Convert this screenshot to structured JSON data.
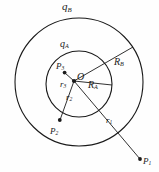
{
  "figure": {
    "center": {
      "label": "O",
      "x": 74,
      "y": 81
    },
    "circles": [
      {
        "name": "outer-shell",
        "charge_label": "q",
        "charge_sub": "B",
        "radius_label": "R",
        "radius_sub": "B",
        "cx": 79,
        "cy": 82,
        "r": 64
      },
      {
        "name": "inner-shell",
        "charge_label": "q",
        "charge_sub": "A",
        "radius_label": "R",
        "radius_sub": "A",
        "cx": 79,
        "cy": 84,
        "r": 33
      }
    ],
    "labels": {
      "q_b": "q",
      "q_b_sub": "B",
      "q_a": "q",
      "q_a_sub": "A",
      "origin": "O",
      "R_b": "R",
      "R_b_sub": "B",
      "R_a": "R",
      "R_a_sub": "A",
      "r_3": "r",
      "r_3_sub": "3",
      "r_2": "r",
      "r_2_sub": "2",
      "r_1": "r",
      "r_1_sub": "1",
      "P_3": "P",
      "P_3_sub": "3",
      "P_2": "P",
      "P_2_sub": "2",
      "P_1": "P",
      "P_1_sub": "1"
    },
    "points": [
      {
        "name": "point-p3",
        "label": "P",
        "sub": "3",
        "x": 65,
        "y": 73,
        "region": "inside-inner-shell"
      },
      {
        "name": "point-p2",
        "label": "P",
        "sub": "2",
        "x": 60,
        "y": 121,
        "region": "between-shells"
      },
      {
        "name": "point-p1",
        "label": "P",
        "sub": "1",
        "x": 140,
        "y": 160,
        "region": "outside-outer-shell"
      }
    ],
    "radial_lines": [
      {
        "name": "line-to-p3",
        "from": [
          74,
          81
        ],
        "to": [
          65,
          73
        ]
      },
      {
        "name": "line-to-p2",
        "from": [
          74,
          81
        ],
        "to": [
          60,
          121
        ]
      },
      {
        "name": "line-to-p1",
        "from": [
          74,
          81
        ],
        "to": [
          140,
          160
        ]
      },
      {
        "name": "line-R-a",
        "from": [
          74,
          81
        ],
        "to": [
          112,
          85
        ]
      },
      {
        "name": "line-R-b",
        "from": [
          74,
          81
        ],
        "to": [
          131,
          49
        ]
      }
    ],
    "colors": {
      "stroke": "#1a1a1a",
      "background": "#fefefe",
      "text": "#1a1a1a"
    }
  }
}
